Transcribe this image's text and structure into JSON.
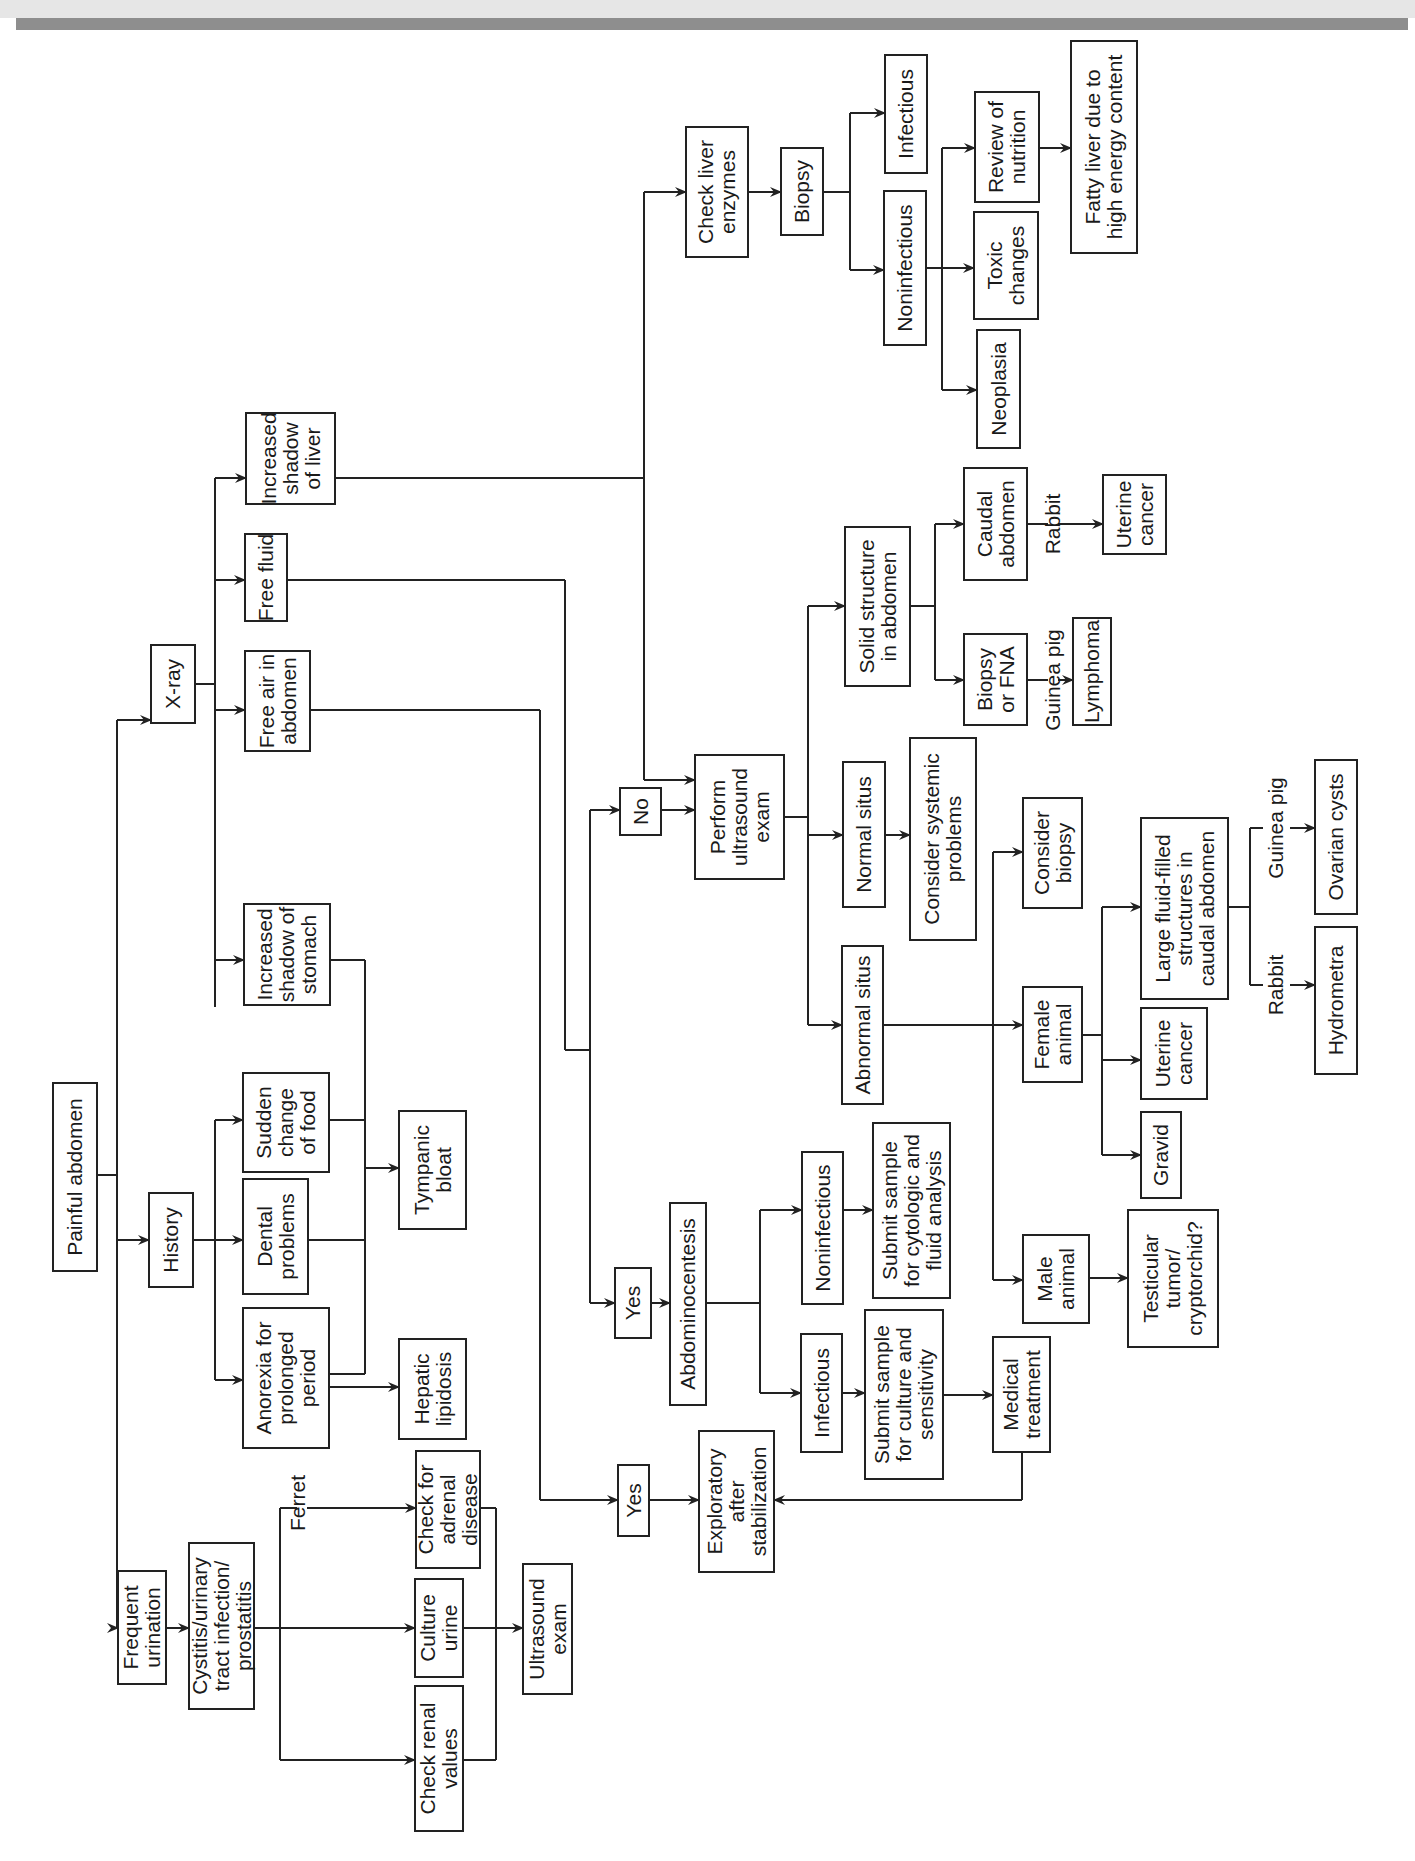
{
  "nodes": {
    "painful_abdomen": [
      "Painful abdomen"
    ],
    "frequent_urination": [
      "Frequent",
      "urination"
    ],
    "history": [
      "History"
    ],
    "xray": [
      "X-ray"
    ],
    "cystitis": [
      "Cystitis/urinary",
      "tract infection/",
      "prostatitis"
    ],
    "anorexia": [
      "Anorexia for",
      "prolonged",
      "period"
    ],
    "dental": [
      "Dental",
      "problems"
    ],
    "sudden_change": [
      "Sudden",
      "change",
      "of food"
    ],
    "inc_shadow_stomach": [
      "Increased",
      "shadow of",
      "stomach"
    ],
    "free_air": [
      "Free air in",
      "abdomen"
    ],
    "free_fluid": [
      "Free fluid"
    ],
    "inc_shadow_liver": [
      "Increased",
      "shadow",
      "of liver"
    ],
    "check_renal": [
      "Check renal",
      "values"
    ],
    "culture_urine": [
      "Culture",
      "urine"
    ],
    "check_adrenal": [
      "Check for",
      "adrenal",
      "disease"
    ],
    "hepatic_lipidosis": [
      "Hepatic",
      "lipidosis"
    ],
    "tympanic_bloat": [
      "Tympanic",
      "bloat"
    ],
    "ultrasound_exam": [
      "Ultrasound",
      "exam"
    ],
    "yes_air": [
      "Yes"
    ],
    "yes_fluid": [
      "Yes"
    ],
    "no_fluid": [
      "No"
    ],
    "exploratory": [
      "Exploratory",
      "after",
      "stabilization"
    ],
    "abdominocentesis": [
      "Abdominocentesis"
    ],
    "perform_ultrasound": [
      "Perform",
      "ultrasound",
      "exam"
    ],
    "check_liver_enzymes": [
      "Check liver",
      "enzymes"
    ],
    "infectious_fluid": [
      "Infectious"
    ],
    "noninfectious_fluid": [
      "Noninfectious"
    ],
    "abnormal_situs": [
      "Abnormal situs"
    ],
    "normal_situs": [
      "Normal situs"
    ],
    "solid_structure": [
      "Solid structure",
      "in abdomen"
    ],
    "biopsy_liver": [
      "Biopsy"
    ],
    "submit_culture": [
      "Submit sample",
      "for culture and",
      "sensitivity"
    ],
    "submit_cytologic": [
      "Submit sample",
      "for cytologic and",
      "fluid analysis"
    ],
    "consider_systemic": [
      "Consider systemic",
      "problems"
    ],
    "biopsy_fna": [
      "Biopsy",
      "or FNA"
    ],
    "caudal_abdomen": [
      "Caudal",
      "abdomen"
    ],
    "noninfectious_liver": [
      "Noninfectious"
    ],
    "infectious_liver": [
      "Infectious"
    ],
    "medical_treatment": [
      "Medical",
      "treatment"
    ],
    "male_animal": [
      "Male",
      "animal"
    ],
    "female_animal": [
      "Female",
      "animal"
    ],
    "consider_biopsy": [
      "Consider",
      "biopsy"
    ],
    "neoplasia": [
      "Neoplasia"
    ],
    "toxic_changes": [
      "Toxic",
      "changes"
    ],
    "testicular": [
      "Testicular",
      "tumor/",
      "cryptorchid?"
    ],
    "gravid": [
      "Gravid"
    ],
    "uterine_cancer_female": [
      "Uterine",
      "cancer"
    ],
    "large_fluid": [
      "Large fluid-filled",
      "structures in",
      "caudal abdomen"
    ],
    "lymphoma": [
      "Lymphoma"
    ],
    "uterine_cancer_rabbit": [
      "Uterine",
      "cancer"
    ],
    "review_nutrition": [
      "Review of",
      "nutrition"
    ],
    "hydrometra": [
      "Hydrometra"
    ],
    "ovarian_cysts": [
      "Ovarian cysts"
    ],
    "fatty_liver": [
      "Fatty liver due to",
      "high energy content"
    ]
  },
  "edge_labels": {
    "ferret": "Ferret",
    "guinea_pig_lymphoma": "Guinea pig",
    "rabbit_uterine": "Rabbit",
    "rabbit_hydrometra": "Rabbit",
    "guinea_pig_ovarian": "Guinea pig"
  }
}
